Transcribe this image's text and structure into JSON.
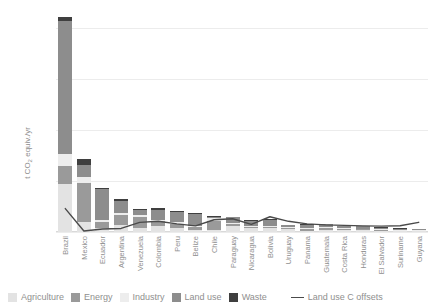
{
  "chart_data": {
    "type": "bar",
    "stacked": true,
    "title": "",
    "xlabel": "",
    "ylabel": "t CO2 equiv./yr",
    "ylabel_parts": {
      "pre": "t CO",
      "sub": "2",
      "post": " equiv./yr"
    },
    "ylim": [
      0,
      2200
    ],
    "yticks": [
      0,
      500,
      1000,
      1500,
      2000
    ],
    "ytick_labels": [
      "0",
      "500",
      "1,000",
      "1,500",
      "2,000"
    ],
    "grid": true,
    "legend_position": "bottom",
    "categories": [
      "Brazil",
      "Mexico",
      "Ecuador",
      "Argentina",
      "Venezuela",
      "Colombia",
      "Peru",
      "Belize",
      "Chile",
      "Paraguay",
      "Nicaragua",
      "Bolivia",
      "Uruguay",
      "Panama",
      "Guatemala",
      "Costa Rica",
      "Honduras",
      "El Salvador",
      "Suriname",
      "Guyana"
    ],
    "series": [
      {
        "name": "Agriculture",
        "color": "#e3e3e3",
        "values": [
          470,
          95,
          40,
          70,
          35,
          55,
          35,
          20,
          18,
          55,
          40,
          35,
          30,
          12,
          22,
          18,
          16,
          10,
          8,
          8
        ]
      },
      {
        "name": "Energy",
        "color": "#9a9a9a",
        "values": [
          180,
          390,
          60,
          95,
          110,
          50,
          45,
          30,
          95,
          25,
          12,
          18,
          12,
          22,
          18,
          14,
          12,
          14,
          6,
          6
        ]
      },
      {
        "name": "Industry",
        "color": "#ededed",
        "values": [
          120,
          60,
          20,
          25,
          20,
          18,
          18,
          10,
          22,
          8,
          6,
          8,
          6,
          8,
          10,
          8,
          6,
          8,
          4,
          4
        ]
      },
      {
        "name": "Land use",
        "color": "#8d8d8d",
        "values": [
          1300,
          115,
          300,
          115,
          50,
          95,
          95,
          120,
          10,
          55,
          55,
          60,
          20,
          30,
          25,
          18,
          22,
          10,
          14,
          12
        ]
      },
      {
        "name": "Waste",
        "color": "#3f3f3f",
        "values": [
          45,
          55,
          15,
          18,
          12,
          14,
          12,
          6,
          14,
          6,
          5,
          6,
          5,
          6,
          6,
          6,
          5,
          5,
          3,
          3
        ]
      }
    ],
    "line_series": {
      "name": "Land use C offsets",
      "color": "#4a4a4a",
      "values": [
        230,
        10,
        30,
        35,
        95,
        105,
        80,
        60,
        120,
        130,
        75,
        150,
        105,
        80,
        70,
        65,
        60,
        58,
        62,
        95
      ]
    }
  },
  "legend": {
    "items": [
      {
        "label": "Agriculture",
        "color": "#e3e3e3"
      },
      {
        "label": "Energy",
        "color": "#9a9a9a"
      },
      {
        "label": "Industry",
        "color": "#ededed"
      },
      {
        "label": "Land use",
        "color": "#8d8d8d"
      },
      {
        "label": "Waste",
        "color": "#3f3f3f"
      }
    ],
    "line_label": "Land use C offsets",
    "line_color": "#4a4a4a"
  }
}
